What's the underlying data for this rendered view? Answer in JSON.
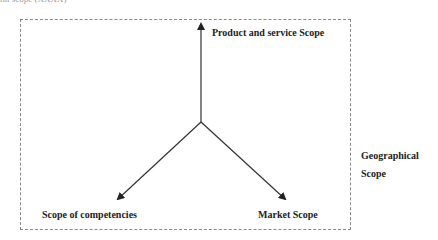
{
  "figure": {
    "caption_fragment": "ral scope (XXXX)",
    "labels": {
      "product": "Product and service Scope",
      "competencies": "Scope of competencies",
      "market": "Market Scope",
      "geographical_line1": "Geographical",
      "geographical_line2": "Scope"
    },
    "colors": {
      "line": "#333333",
      "frame": "#888888",
      "text": "#222222"
    },
    "origin": {
      "x": 201,
      "y": 122
    },
    "arrows": [
      {
        "name": "product",
        "to": {
          "x": 201,
          "y": 22
        }
      },
      {
        "name": "competencies",
        "to": {
          "x": 116,
          "y": 201
        }
      },
      {
        "name": "market",
        "to": {
          "x": 287,
          "y": 201
        }
      }
    ]
  }
}
